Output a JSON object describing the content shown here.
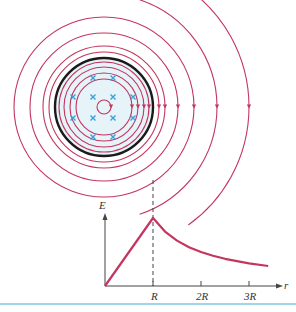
{
  "figure": {
    "colors": {
      "field_line": "#c2365f",
      "boundary": "#1a1a1a",
      "charge_marker": "#3aa0d8",
      "fill": "#e6f3f8",
      "axis": "#444444",
      "curve": "#c2365f",
      "bottom_rule": "#9fd4ea"
    },
    "field_circles": {
      "center": [
        104,
        107
      ],
      "inner_radii": [
        7,
        28,
        34,
        40,
        45,
        55,
        61,
        74,
        90
      ],
      "boundary_radius": 49,
      "outer_arc_radii": [
        113,
        145
      ]
    },
    "charge_markers": [
      [
        93,
        78
      ],
      [
        113,
        78
      ],
      [
        73,
        97
      ],
      [
        93,
        97
      ],
      [
        113,
        97
      ],
      [
        133,
        97
      ],
      [
        73,
        118
      ],
      [
        93,
        118
      ],
      [
        113,
        118
      ],
      [
        133,
        118
      ],
      [
        93,
        137
      ],
      [
        113,
        137
      ]
    ],
    "graph": {
      "y_axis_label": "E",
      "x_axis_label": "r",
      "tick_labels": [
        "R",
        "2R",
        "3R"
      ]
    }
  },
  "chart_data": {
    "type": "line",
    "title": "",
    "xlabel": "r",
    "ylabel": "E",
    "x_ticks": [
      "R",
      "2R",
      "3R"
    ],
    "series": [
      {
        "name": "E(r)",
        "x": [
          0,
          0.25,
          0.5,
          0.75,
          1.0,
          1.25,
          1.5,
          1.75,
          2.0,
          2.25,
          2.5,
          2.75,
          3.0,
          3.4
        ],
        "values": [
          0,
          0.25,
          0.5,
          0.75,
          1.0,
          0.8,
          0.667,
          0.571,
          0.5,
          0.444,
          0.4,
          0.364,
          0.333,
          0.294
        ]
      }
    ],
    "annotations": [
      "dashed vertical line at r = R linking graph peak to cylinder surface"
    ],
    "grid": false
  }
}
